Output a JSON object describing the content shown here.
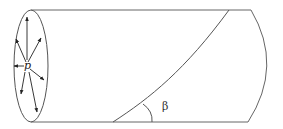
{
  "diagram": {
    "labels": {
      "pressure": "p",
      "angle": "β"
    },
    "colors": {
      "stroke": "#555555",
      "arrow": "#222222"
    }
  }
}
